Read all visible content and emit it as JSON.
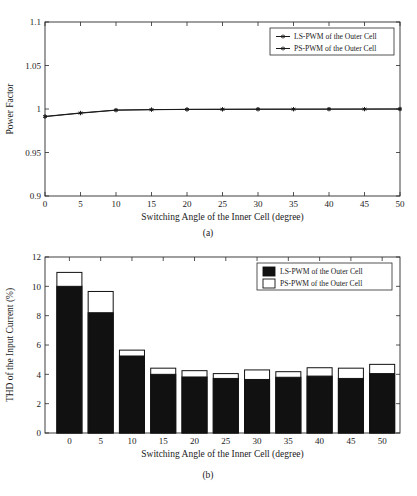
{
  "figure": {
    "panel_a_caption": "(a)",
    "panel_b_caption": "(b)"
  },
  "chart_data": [
    {
      "type": "line",
      "panel": "(a)",
      "title": "",
      "xlabel": "Switching Angle of the Inner Cell (degree)",
      "ylabel": "Power Factor",
      "xlim": [
        0,
        50
      ],
      "ylim": [
        0.9,
        1.1
      ],
      "xticks": [
        0,
        5,
        10,
        15,
        20,
        25,
        30,
        35,
        40,
        45,
        50
      ],
      "yticks": [
        0.9,
        0.95,
        1,
        1.05,
        1.1
      ],
      "xticklabels": [
        "0",
        "5",
        "10",
        "15",
        "20",
        "25",
        "30",
        "35",
        "40",
        "45",
        "50"
      ],
      "yticklabels": [
        "0.9",
        "0.95",
        "1",
        "1.05",
        "1.1"
      ],
      "grid": false,
      "legend_position": "upper right",
      "x": [
        0,
        5,
        10,
        15,
        20,
        25,
        30,
        35,
        40,
        45,
        50
      ],
      "series": [
        {
          "name": "LS-PWM of the Outer Cell",
          "marker": "asterisk",
          "color": "#1a1a1a",
          "values": [
            0.9915,
            0.9955,
            0.9988,
            0.9993,
            0.9996,
            0.9997,
            0.9998,
            0.9998,
            0.9999,
            0.9999,
            1.0
          ]
        },
        {
          "name": "PS-PWM of the Outer Cell",
          "marker": "asterisk",
          "color": "#1a1a1a",
          "values": [
            0.9912,
            0.9952,
            0.9986,
            0.9992,
            0.9995,
            0.9996,
            0.9997,
            0.9998,
            0.9998,
            0.9999,
            1.0
          ]
        }
      ]
    },
    {
      "type": "bar",
      "panel": "(b)",
      "title": "",
      "xlabel": "Switching Angle of the Inner Cell (degree)",
      "ylabel": "THD of the Input Current (%)",
      "ylim": [
        0,
        12
      ],
      "yticks": [
        0,
        2,
        4,
        6,
        8,
        10,
        12
      ],
      "yticklabels": [
        "0",
        "2",
        "4",
        "6",
        "8",
        "10",
        "12"
      ],
      "categories": [
        "0",
        "5",
        "10",
        "15",
        "20",
        "25",
        "30",
        "35",
        "40",
        "45",
        "50"
      ],
      "grid": false,
      "legend_position": "upper right",
      "bar_style": "overlaid",
      "series": [
        {
          "name": "LS-PWM of the Outer Cell",
          "fill": "#111111",
          "edge": "#111111",
          "values": [
            10.0,
            8.2,
            5.25,
            4.0,
            3.82,
            3.72,
            3.65,
            3.8,
            3.88,
            3.72,
            4.05
          ]
        },
        {
          "name": "PS-PWM of the Outer Cell",
          "fill": "#ffffff",
          "edge": "#111111",
          "values": [
            10.95,
            9.65,
            5.65,
            4.42,
            4.25,
            4.05,
            4.3,
            4.18,
            4.45,
            4.42,
            4.68
          ]
        }
      ]
    }
  ]
}
